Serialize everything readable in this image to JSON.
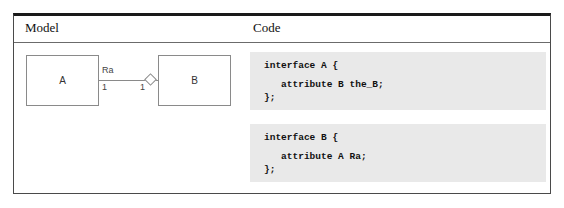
{
  "figure": {
    "columns": [
      {
        "header": "Model"
      },
      {
        "header": "Code"
      }
    ]
  },
  "model": {
    "diagram_type": "uml-class-aggregation",
    "classes": [
      {
        "name": "A"
      },
      {
        "name": "B"
      }
    ],
    "association": {
      "name": "Ra",
      "source_multiplicity": "1",
      "target_multiplicity": "1",
      "end_decoration": "hollow-diamond-aggregation"
    }
  },
  "code": {
    "blocks": [
      {
        "name": "interface-a",
        "lines": [
          "interface A {",
          "",
          "   attribute B the_B;",
          "};"
        ]
      },
      {
        "name": "interface-b",
        "lines": [
          "interface B {",
          "",
          "   attribute A Ra;",
          "};"
        ]
      }
    ]
  },
  "colors": {
    "table_top_rule": "#1a1a1a",
    "table_border": "#4a4a4a",
    "code_background": "#e9e9e9",
    "diagram_stroke": "#8a8a8a"
  }
}
